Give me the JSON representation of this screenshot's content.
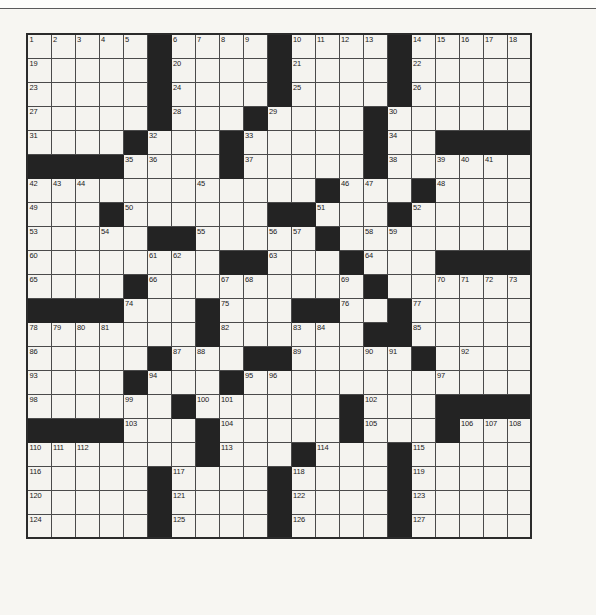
{
  "page": {
    "background_color": "#f7f6f2",
    "rule_color": "#5a5a5a"
  },
  "grid": {
    "name": "crossword-grid",
    "columns": 21,
    "rows": 21,
    "cell_size_px": 26,
    "origin": {
      "x": 26,
      "y": 33
    },
    "white_color": "#f4f3ef",
    "black_color": "#232323",
    "line_color": "#4a4a4a",
    "border_color": "#2b2b2b",
    "number_color": "#1b1b1b",
    "max_clue_number": 127,
    "legend": "1 = black (blocked) square, 0 = white (fillable) square",
    "blocks": [
      [
        0,
        0,
        0,
        0,
        0,
        1,
        0,
        0,
        0,
        0,
        1,
        0,
        0,
        0,
        0,
        1,
        0,
        0,
        0,
        0,
        0
      ],
      [
        0,
        0,
        0,
        0,
        0,
        1,
        0,
        0,
        0,
        0,
        1,
        0,
        0,
        0,
        0,
        1,
        0,
        0,
        0,
        0,
        0
      ],
      [
        0,
        0,
        0,
        0,
        0,
        1,
        0,
        0,
        0,
        0,
        1,
        0,
        0,
        0,
        0,
        1,
        0,
        0,
        0,
        0,
        0
      ],
      [
        0,
        0,
        0,
        0,
        0,
        1,
        0,
        0,
        0,
        1,
        0,
        0,
        0,
        0,
        1,
        0,
        0,
        0,
        0,
        0,
        0
      ],
      [
        0,
        0,
        0,
        0,
        1,
        0,
        0,
        0,
        1,
        0,
        0,
        0,
        0,
        0,
        1,
        0,
        0,
        1,
        1,
        1,
        1
      ],
      [
        1,
        1,
        1,
        1,
        0,
        0,
        0,
        0,
        1,
        0,
        0,
        0,
        0,
        0,
        1,
        0,
        0,
        0,
        0,
        0,
        0
      ],
      [
        0,
        0,
        0,
        0,
        0,
        0,
        0,
        0,
        0,
        0,
        0,
        0,
        1,
        0,
        0,
        0,
        1,
        0,
        0,
        0,
        0
      ],
      [
        0,
        0,
        0,
        1,
        0,
        0,
        0,
        0,
        0,
        0,
        1,
        1,
        0,
        0,
        0,
        1,
        0,
        0,
        0,
        0,
        0
      ],
      [
        0,
        0,
        0,
        0,
        0,
        1,
        1,
        0,
        0,
        0,
        0,
        0,
        1,
        0,
        0,
        0,
        0,
        0,
        0,
        0,
        0
      ],
      [
        0,
        0,
        0,
        0,
        0,
        0,
        0,
        0,
        1,
        1,
        0,
        0,
        0,
        1,
        0,
        0,
        0,
        1,
        1,
        1,
        1
      ],
      [
        0,
        0,
        0,
        0,
        1,
        0,
        0,
        0,
        0,
        0,
        0,
        0,
        0,
        0,
        1,
        0,
        0,
        0,
        0,
        0,
        0
      ],
      [
        1,
        1,
        1,
        1,
        0,
        0,
        0,
        1,
        0,
        0,
        0,
        1,
        1,
        0,
        0,
        1,
        0,
        0,
        0,
        0,
        0
      ],
      [
        0,
        0,
        0,
        0,
        0,
        0,
        0,
        1,
        0,
        0,
        0,
        0,
        0,
        0,
        1,
        1,
        0,
        0,
        0,
        0,
        0
      ],
      [
        0,
        0,
        0,
        0,
        0,
        1,
        0,
        0,
        0,
        1,
        1,
        0,
        0,
        0,
        0,
        0,
        1,
        0,
        0,
        0,
        0
      ],
      [
        0,
        0,
        0,
        0,
        1,
        0,
        0,
        0,
        1,
        0,
        0,
        0,
        0,
        0,
        0,
        0,
        0,
        0,
        0,
        0,
        0
      ],
      [
        0,
        0,
        0,
        0,
        0,
        0,
        1,
        0,
        0,
        0,
        0,
        0,
        0,
        1,
        0,
        0,
        0,
        1,
        1,
        1,
        1
      ],
      [
        1,
        1,
        1,
        1,
        0,
        0,
        0,
        1,
        0,
        0,
        0,
        0,
        0,
        1,
        0,
        0,
        0,
        1,
        0,
        0,
        0
      ],
      [
        0,
        0,
        0,
        0,
        0,
        0,
        0,
        1,
        0,
        0,
        0,
        1,
        0,
        0,
        0,
        1,
        0,
        0,
        0,
        0,
        0
      ],
      [
        0,
        0,
        0,
        0,
        0,
        1,
        0,
        0,
        0,
        0,
        1,
        0,
        0,
        0,
        0,
        1,
        0,
        0,
        0,
        0,
        0
      ],
      [
        0,
        0,
        0,
        0,
        0,
        1,
        0,
        0,
        0,
        0,
        1,
        0,
        0,
        0,
        0,
        1,
        0,
        0,
        0,
        0,
        0
      ],
      [
        0,
        0,
        0,
        0,
        0,
        1,
        0,
        0,
        0,
        0,
        1,
        0,
        0,
        0,
        0,
        1,
        0,
        0,
        0,
        0,
        0
      ]
    ],
    "numbers": [
      [
        1,
        2,
        3,
        4,
        5,
        null,
        6,
        7,
        8,
        9,
        null,
        10,
        11,
        12,
        13,
        null,
        14,
        15,
        16,
        17,
        18
      ],
      [
        19,
        null,
        null,
        null,
        null,
        null,
        20,
        null,
        null,
        null,
        null,
        21,
        null,
        null,
        null,
        null,
        22,
        null,
        null,
        null,
        null
      ],
      [
        23,
        null,
        null,
        null,
        null,
        null,
        24,
        null,
        null,
        null,
        null,
        25,
        null,
        null,
        null,
        null,
        26,
        null,
        null,
        null,
        null
      ],
      [
        27,
        null,
        null,
        null,
        null,
        null,
        28,
        null,
        null,
        null,
        29,
        null,
        null,
        null,
        null,
        30,
        null,
        null,
        null,
        null,
        null
      ],
      [
        31,
        null,
        null,
        null,
        null,
        32,
        null,
        null,
        null,
        33,
        null,
        null,
        null,
        null,
        null,
        34,
        null,
        null,
        null,
        null,
        null
      ],
      [
        null,
        null,
        null,
        null,
        35,
        36,
        null,
        null,
        null,
        37,
        null,
        null,
        null,
        null,
        null,
        38,
        null,
        39,
        40,
        41,
        null
      ],
      [
        42,
        43,
        44,
        null,
        null,
        null,
        null,
        45,
        null,
        null,
        null,
        null,
        null,
        46,
        47,
        null,
        null,
        48,
        null,
        null,
        null
      ],
      [
        49,
        null,
        null,
        null,
        50,
        null,
        null,
        null,
        null,
        null,
        null,
        null,
        51,
        null,
        null,
        null,
        52,
        null,
        null,
        null,
        null
      ],
      [
        53,
        null,
        null,
        54,
        null,
        null,
        null,
        55,
        null,
        null,
        56,
        57,
        null,
        null,
        58,
        59,
        null,
        null,
        null,
        null,
        null
      ],
      [
        60,
        null,
        null,
        null,
        null,
        61,
        62,
        null,
        null,
        null,
        63,
        null,
        null,
        null,
        64,
        null,
        null,
        null,
        null,
        null,
        null
      ],
      [
        65,
        null,
        null,
        null,
        null,
        66,
        null,
        null,
        67,
        68,
        null,
        null,
        null,
        69,
        null,
        null,
        null,
        70,
        71,
        72,
        73
      ],
      [
        null,
        null,
        null,
        null,
        74,
        null,
        null,
        null,
        75,
        null,
        null,
        null,
        null,
        76,
        null,
        null,
        77,
        null,
        null,
        null,
        null
      ],
      [
        78,
        79,
        80,
        81,
        null,
        null,
        null,
        null,
        82,
        null,
        null,
        83,
        84,
        null,
        null,
        null,
        85,
        null,
        null,
        null,
        null
      ],
      [
        86,
        null,
        null,
        null,
        null,
        null,
        87,
        88,
        null,
        null,
        null,
        89,
        null,
        null,
        90,
        91,
        null,
        null,
        92,
        null,
        null
      ],
      [
        93,
        null,
        null,
        null,
        null,
        94,
        null,
        null,
        null,
        95,
        96,
        null,
        null,
        null,
        null,
        null,
        null,
        97,
        null,
        null,
        null
      ],
      [
        98,
        null,
        null,
        null,
        99,
        null,
        null,
        100,
        101,
        null,
        null,
        null,
        null,
        null,
        102,
        null,
        null,
        null,
        null,
        null,
        null
      ],
      [
        null,
        null,
        null,
        null,
        103,
        null,
        null,
        null,
        104,
        null,
        null,
        null,
        null,
        null,
        105,
        null,
        null,
        null,
        106,
        107,
        108,
        109
      ],
      [
        110,
        111,
        112,
        null,
        null,
        null,
        null,
        null,
        113,
        null,
        null,
        null,
        114,
        null,
        null,
        null,
        115,
        null,
        null,
        null,
        null
      ],
      [
        116,
        null,
        null,
        null,
        null,
        null,
        117,
        null,
        null,
        null,
        null,
        118,
        null,
        null,
        null,
        null,
        119,
        null,
        null,
        null,
        null
      ],
      [
        120,
        null,
        null,
        null,
        null,
        null,
        121,
        null,
        null,
        null,
        null,
        122,
        null,
        null,
        null,
        null,
        123,
        null,
        null,
        null,
        null
      ],
      [
        124,
        null,
        null,
        null,
        null,
        null,
        125,
        null,
        null,
        null,
        null,
        126,
        null,
        null,
        null,
        null,
        127,
        null,
        null,
        null,
        null
      ]
    ]
  }
}
